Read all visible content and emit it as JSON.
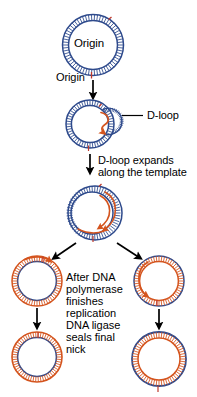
{
  "figure": {
    "title_text_present": false,
    "background_color": "#ffffff",
    "strand_colors": {
      "template_blue": "#2e4a8c",
      "new_strand_orange": "#d4541e",
      "nick_mark": "#c0392b",
      "arrow_black": "#000000",
      "text_black": "#000000"
    }
  },
  "labels": {
    "origin_inside_circle": "Origin",
    "origin_below_circle": "Origin",
    "d_loop": "D-loop",
    "d_loop_expands_line1": "D-loop expands",
    "d_loop_expands_line2": "along the template",
    "ligase_block": {
      "line1": "After DNA",
      "line2": "polymerase",
      "line3": "finishes",
      "line4": "replication",
      "line5": "DNA ligase",
      "line6": "seals final",
      "line7": "nick"
    }
  },
  "steps": [
    {
      "id": "step-1",
      "name": "circular-dna-with-origin",
      "description": "Origin",
      "outer_strand": "blue",
      "inner_strand": "blue"
    },
    {
      "id": "step-2",
      "name": "d-loop-formed",
      "description": "D-loop",
      "outer_strand": "blue",
      "inner_strand": "blue",
      "has_loop_bubble": true
    },
    {
      "id": "step-3",
      "name": "d-loop-expanded",
      "description": "D-loop expands along the template",
      "outer_strand": "blue",
      "inner_strand": "blue",
      "has_expanded_loop": true
    },
    {
      "id": "step-4-left",
      "name": "daughter-molecule-left-nicked",
      "outer_strand": "orange",
      "inner_strand": "blue"
    },
    {
      "id": "step-4-right",
      "name": "daughter-molecule-right-nicked",
      "outer_strand": "blue",
      "inner_strand": "orange"
    },
    {
      "id": "step-5-left",
      "name": "daughter-molecule-left-sealed",
      "outer_strand": "orange",
      "inner_strand": "blue"
    },
    {
      "id": "step-5-right",
      "name": "daughter-molecule-right-sealed",
      "outer_strand": "blue",
      "inner_strand": "orange"
    }
  ],
  "arrows": [
    {
      "id": "arrow-1",
      "name": "arrow-step1-to-step2",
      "direction": "down"
    },
    {
      "id": "arrow-2",
      "name": "arrow-step2-to-step3",
      "direction": "down"
    },
    {
      "id": "arrow-3",
      "name": "arrow-fork-left",
      "direction": "down-left"
    },
    {
      "id": "arrow-4",
      "name": "arrow-fork-right",
      "direction": "down-right"
    },
    {
      "id": "arrow-5",
      "name": "arrow-left-to-final",
      "direction": "down"
    },
    {
      "id": "arrow-6",
      "name": "arrow-right-to-final",
      "direction": "down"
    }
  ]
}
